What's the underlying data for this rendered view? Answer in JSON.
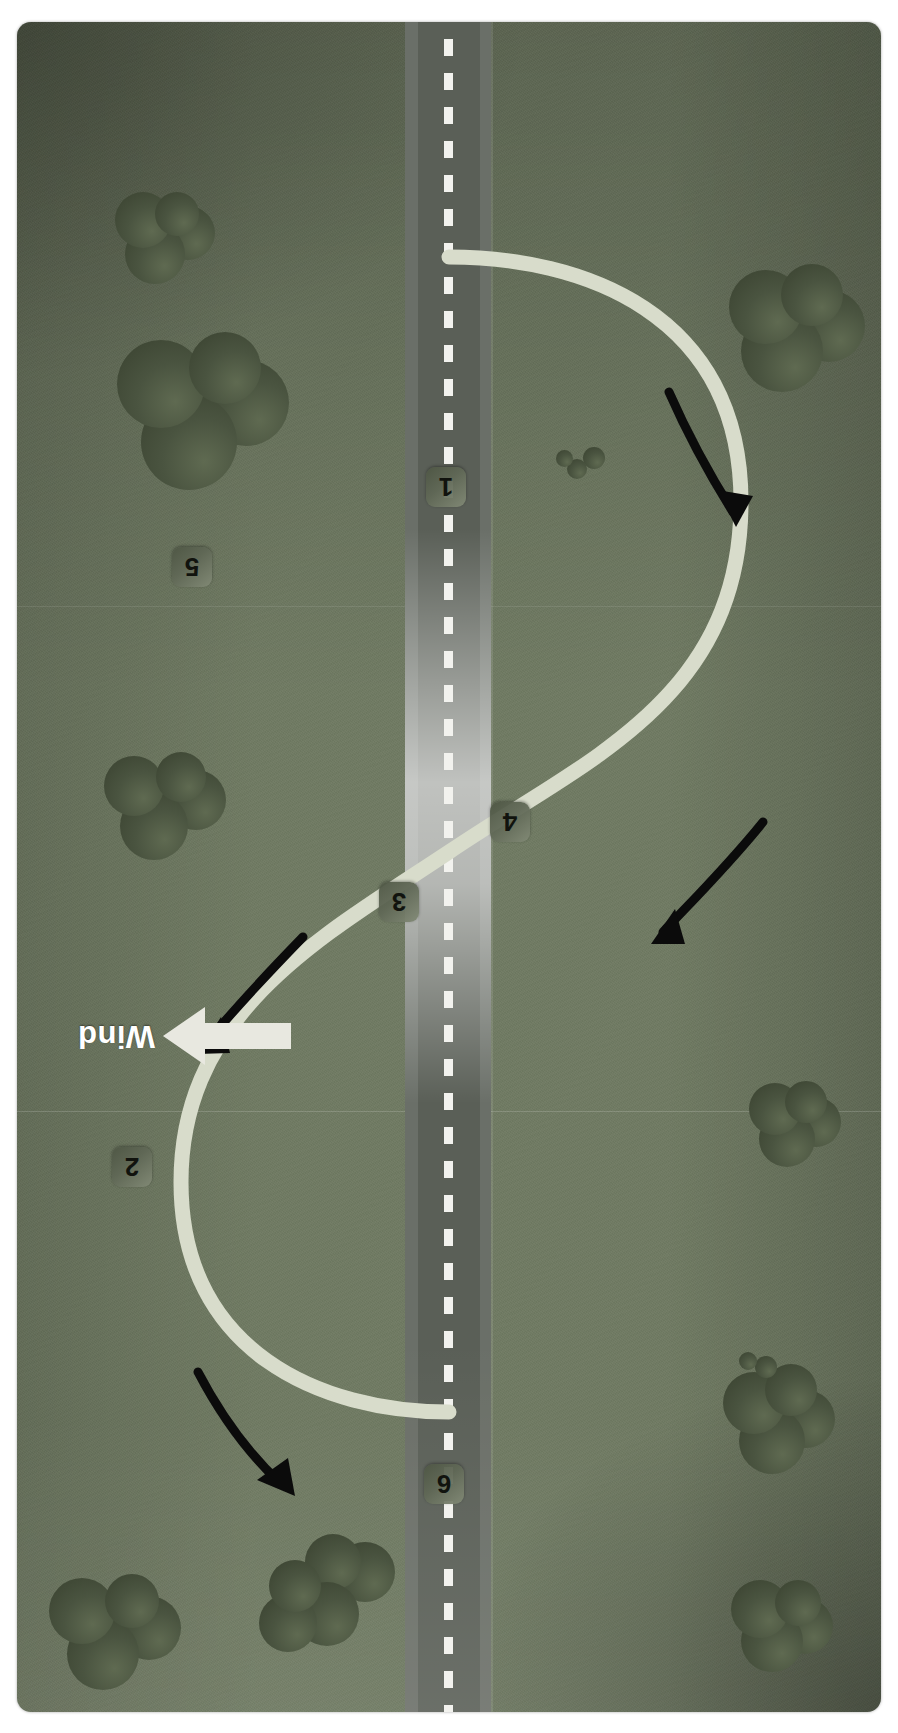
{
  "diagram": {
    "orientation": "rotated-180",
    "background_color": "#707b63",
    "road_color": "#5a5f57",
    "path_color": "#d8dccb",
    "arrow_color": "#000000",
    "wind_arrow_color": "#e8e8e0"
  },
  "wind": {
    "label": "Wind",
    "direction": "left",
    "arrow_icon": "wind-arrow-left-icon"
  },
  "waypoints": [
    {
      "id": "1",
      "label": "1"
    },
    {
      "id": "2",
      "label": "2"
    },
    {
      "id": "3",
      "label": "3"
    },
    {
      "id": "4",
      "label": "4"
    },
    {
      "id": "5",
      "label": "5"
    },
    {
      "id": "6",
      "label": "6"
    }
  ],
  "direction_arrows": [
    {
      "id": "arrow-leg-1",
      "name": "direction-arrow-icon"
    },
    {
      "id": "arrow-leg-2",
      "name": "direction-arrow-icon"
    },
    {
      "id": "arrow-leg-3",
      "name": "direction-arrow-icon"
    },
    {
      "id": "arrow-leg-4",
      "name": "direction-arrow-icon"
    }
  ],
  "road": {
    "centerline_style": "dashed-white",
    "name": "reference-road"
  },
  "scenery": {
    "bush_count": 12,
    "item_name": "bush-cluster"
  }
}
